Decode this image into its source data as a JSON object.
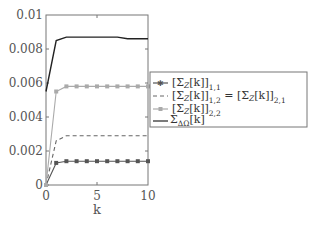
{
  "chart_data": {
    "type": "line",
    "title": "",
    "xlabel": "k",
    "ylabel": "",
    "xlim": [
      0,
      10
    ],
    "ylim": [
      0,
      0.01
    ],
    "x_ticks": [
      "0",
      "5",
      "10"
    ],
    "y_ticks": [
      "0",
      "0.002",
      "0.004",
      "0.006",
      "0.008",
      "0.01"
    ],
    "grid": false,
    "legend_position": "right-outside",
    "x": [
      0,
      1,
      2,
      3,
      4,
      5,
      6,
      7,
      8,
      9,
      10
    ],
    "series": [
      {
        "name": "[Σ_Z[k]]_{1,1}",
        "style": "solid-dark-star-markers",
        "color": "#555555",
        "values": [
          0,
          0.0013,
          0.0014,
          0.0014,
          0.0014,
          0.0014,
          0.0014,
          0.0014,
          0.0014,
          0.0014,
          0.0014
        ]
      },
      {
        "name": "[Σ_Z[k]]_{1,2} = [Σ_Z[k]]_{2,1}",
        "style": "dashed",
        "color": "#666666",
        "values": [
          0,
          0.0026,
          0.0029,
          0.0029,
          0.0029,
          0.0029,
          0.0029,
          0.0029,
          0.0029,
          0.0029,
          0.0029
        ]
      },
      {
        "name": "[Σ_Z[k]]_{2,2}",
        "style": "solid-light-square-markers",
        "color": "#aaaaaa",
        "values": [
          0,
          0.0055,
          0.0058,
          0.0058,
          0.0058,
          0.0058,
          0.0058,
          0.0058,
          0.0058,
          0.0058,
          0.0058
        ]
      },
      {
        "name": "Σ_{ΔΩ}[k]",
        "style": "solid-black",
        "color": "#222222",
        "values": [
          0.0055,
          0.0085,
          0.0087,
          0.0087,
          0.0087,
          0.0087,
          0.0087,
          0.0087,
          0.0086,
          0.0086,
          0.0086
        ]
      }
    ]
  },
  "legend": {
    "items": [
      {
        "base": "[Σ",
        "z": "Z",
        "rest": "[k]]",
        "sub": "1,1"
      },
      {
        "base": "[Σ",
        "z": "Z",
        "rest": "[k]]",
        "sub": "1,2",
        "eq": "= [Σ",
        "z2": "Z",
        "rest2": "[k]]",
        "sub2": "2,1"
      },
      {
        "base": "[Σ",
        "z": "Z",
        "rest": "[k]]",
        "sub": "2,2"
      },
      {
        "base": "Σ",
        "sub": "ΔΩ",
        "rest": "[k]"
      }
    ]
  },
  "axes": {
    "xlabel": "k",
    "xticks": [
      "0",
      "5",
      "10"
    ],
    "yticks": [
      "0",
      "0.002",
      "0.004",
      "0.006",
      "0.008",
      "0.01"
    ]
  }
}
